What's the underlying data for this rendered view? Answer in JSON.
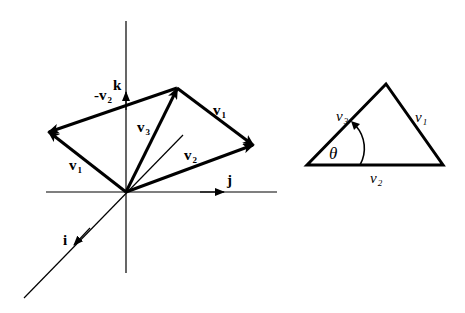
{
  "figure": {
    "left_diagram": {
      "axes": {
        "i": "i",
        "j": "j",
        "k": "k"
      },
      "vectors": [
        {
          "name": "v",
          "sub": "1",
          "from": "origin",
          "to": "left vertex",
          "label_position": "lower-left"
        },
        {
          "name": "-v",
          "sub": "2",
          "from": "right vertex... top",
          "label_position": "upper-left"
        },
        {
          "name": "v",
          "sub": "3",
          "from": "origin",
          "to": "top vertex",
          "label_position": "middle"
        },
        {
          "name": "v",
          "sub": "1",
          "from": "top vertex",
          "to": "right vertex",
          "label_position": "upper-right"
        },
        {
          "name": "v",
          "sub": "2",
          "from": "origin",
          "to": "right vertex",
          "label_position": "lower-right"
        }
      ],
      "labels": {
        "v1_left": {
          "main": "v",
          "sub": "1"
        },
        "neg_v2": {
          "main": "-v",
          "sub": "2"
        },
        "v3": {
          "main": "v",
          "sub": "3"
        },
        "v1_right": {
          "main": "v",
          "sub": "1"
        },
        "v2": {
          "main": "v",
          "sub": "2"
        }
      }
    },
    "right_diagram": {
      "shape": "triangle",
      "labels": {
        "v3": {
          "main": "v",
          "sub": "3"
        },
        "v1": {
          "main": "v",
          "sub": "1"
        },
        "v2": {
          "main": "v",
          "sub": "2"
        },
        "angle": "θ"
      }
    }
  }
}
